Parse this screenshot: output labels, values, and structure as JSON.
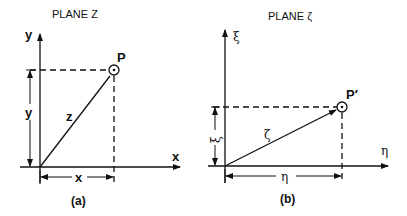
{
  "panel_a": {
    "title": "PLANE Z",
    "caption": "(a)",
    "axis_x_label": "x",
    "axis_y_label": "y",
    "point_label": "P",
    "vector_label": "z",
    "dim_x_label": "x",
    "dim_y_label": "y"
  },
  "panel_b": {
    "title": "PLANE ζ",
    "caption": "(b)",
    "axis_x_label": "η",
    "axis_y_label": "ξ",
    "point_label": "P′",
    "vector_label": "ζ",
    "dim_x_label": "η",
    "dim_y_label": "ξ"
  },
  "colors": {
    "ink": "#111111",
    "background": "#ffffff"
  }
}
